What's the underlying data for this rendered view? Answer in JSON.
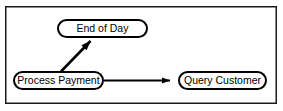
{
  "diagram": {
    "frame": {
      "name": "outer-border",
      "x": 5,
      "y": 6,
      "width": 272,
      "height": 98,
      "stroke": "#1a1a1a",
      "fill": "#ffffff"
    },
    "style": {
      "node_stroke": "#000000",
      "node_fill": "#ffffff",
      "node_stroke_width": 2,
      "edge_stroke": "#000000",
      "edge_stroke_width": 2.2,
      "text_color": "#000000",
      "background": "#ffffff"
    },
    "nodes": [
      {
        "id": "end-of-day",
        "label": "End of Day",
        "shape": "stadium",
        "x": 57,
        "y": 19,
        "width": 91,
        "height": 19,
        "cx": 102.5,
        "cy": 28.5
      },
      {
        "id": "process-payment",
        "label": "Process Payment",
        "shape": "stadium",
        "x": 13,
        "y": 71,
        "width": 91,
        "height": 19,
        "cx": 58.5,
        "cy": 80.5
      },
      {
        "id": "query-customer",
        "label": "Query Customer",
        "shape": "stadium",
        "x": 178,
        "y": 71,
        "width": 89,
        "height": 19,
        "cx": 222.5,
        "cy": 80.5
      }
    ],
    "edges": [
      {
        "id": "edge-payment-to-endofday",
        "from": "process-payment",
        "to": "end-of-day",
        "label": "",
        "arrowhead": "filled-triangle",
        "x1": 61,
        "y1": 71,
        "x2": 92,
        "y2": 39
      },
      {
        "id": "edge-payment-to-query",
        "from": "process-payment",
        "to": "query-customer",
        "label": "",
        "arrowhead": "filled-triangle",
        "x1": 104,
        "y1": 80.5,
        "x2": 178,
        "y2": 80.5
      }
    ]
  }
}
